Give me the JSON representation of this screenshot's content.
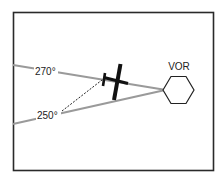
{
  "diagram": {
    "vor_label": "VOR",
    "radials": [
      {
        "label": "270°",
        "color": "#9a9a9a"
      },
      {
        "label": "250°",
        "color": "#9a9a9a"
      }
    ],
    "colors": {
      "frame": "#2a2a2a",
      "radial_line": "#9a9a9a",
      "aircraft": "#111111",
      "dashed_line": "#222222",
      "hexagon": "#222222"
    }
  }
}
